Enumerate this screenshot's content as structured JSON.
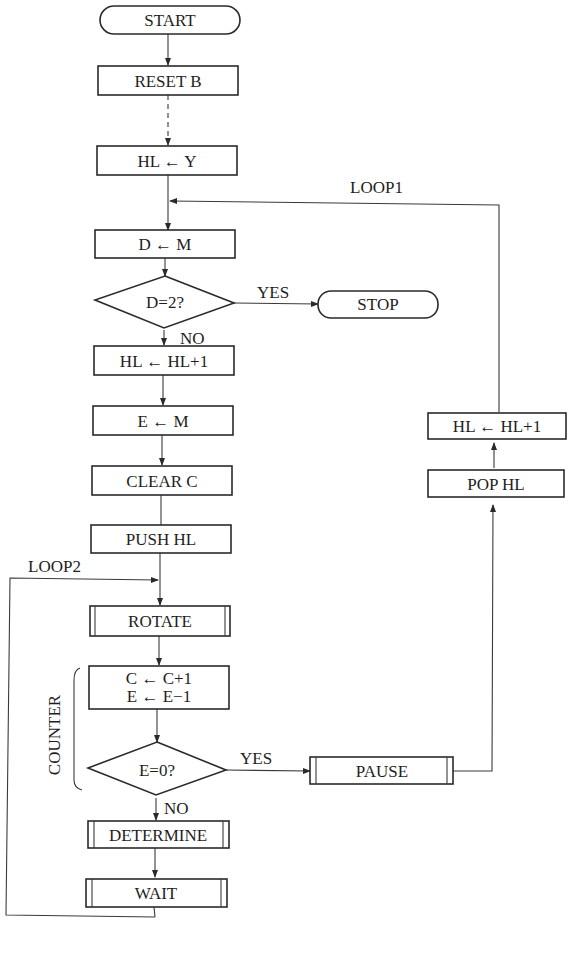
{
  "diagram": {
    "type": "flowchart",
    "nodes": {
      "start": "START",
      "reset_b": "RESET B",
      "hl_y": "HL ← Y",
      "d_m": "D ← M",
      "d_eq_2": "D=2?",
      "stop": "STOP",
      "hl_inc_1": "HL ← HL+1",
      "e_m": "E ← M",
      "clear_c": "CLEAR C",
      "push_hl": "PUSH HL",
      "rotate": "ROTATE",
      "c_inc": "C ← C+1",
      "e_dec": "E ← E−1",
      "e_eq_0": "E=0?",
      "determine": "DETERMINE",
      "wait": "WAIT",
      "pause": "PAUSE",
      "pop_hl": "POP HL",
      "hl_inc_2": "HL ← HL+1"
    },
    "labels": {
      "yes1": "YES",
      "no1": "NO",
      "yes2": "YES",
      "no2": "NO",
      "loop1": "LOOP1",
      "loop2": "LOOP2",
      "counter": "COUNTER"
    }
  }
}
